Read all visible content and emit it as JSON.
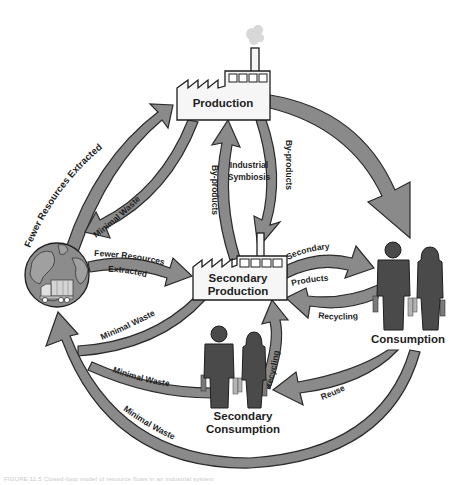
{
  "nodes": {
    "production": "Production",
    "secondary_production_line1": "Secondary",
    "secondary_production_line2": "Production",
    "consumption": "Consumption",
    "secondary_consumption_line1": "Secondary",
    "secondary_consumption_line2": "Consumption",
    "industrial_symbiosis_line1": "Industrial",
    "industrial_symbiosis_line2": "Symbiosis"
  },
  "flows": {
    "earth_to_production": "Fewer Resources Extracted",
    "production_to_earth": "Minimal Waste",
    "earth_to_secondary_line1": "Fewer Resources",
    "earth_to_secondary_line2": "Extracted",
    "secondary_to_production": "By-products",
    "production_to_secondary": "By-products",
    "secondary_to_consumption_line1": "Secondary",
    "secondary_to_consumption_line2": "Products",
    "consumption_to_secondary": "Recycling",
    "secondary_consumption_to_secondary_production": "Recycling",
    "consumption_to_secondary_consumption": "Reuse",
    "secondary_production_to_earth": "Minimal Waste",
    "secondary_consumption_to_earth": "Minimal Waste",
    "consumption_to_earth": "Minimal Waste"
  },
  "icons": {
    "earth": "globe-icon",
    "truck": "garbage-truck-icon",
    "factory": "factory-icon",
    "people": "shopper-people-icon"
  },
  "colors": {
    "arrow_fill": "#8a8a8a",
    "arrow_stroke": "#2a2a2a",
    "people_fill": "#4a4a4a",
    "globe_fill": "#8c8c8c",
    "background": "#ffffff"
  },
  "caption": "FIGURE 11.5 Closed-loop model of resource flows in an industrial system"
}
